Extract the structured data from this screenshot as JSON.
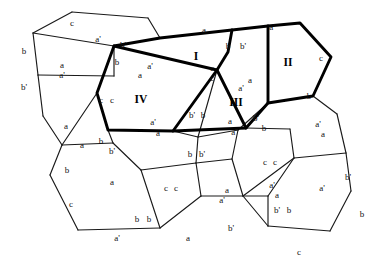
{
  "figure": {
    "background_color": "#ffffff",
    "line_color": "#1a1a1a",
    "thick_line_color": "#000000",
    "label_color": "#111111"
  },
  "regions": [
    {
      "id": "region-I",
      "label": "I",
      "x": 196,
      "y": 57,
      "emphasis": "thick"
    },
    {
      "id": "region-II",
      "label": "II",
      "x": 288,
      "y": 63,
      "emphasis": "thick"
    },
    {
      "id": "region-III",
      "label": "III",
      "x": 236,
      "y": 103,
      "emphasis": "thick"
    },
    {
      "id": "region-IV",
      "label": "IV",
      "x": 141,
      "y": 100,
      "emphasis": "thick"
    }
  ],
  "thick_outline": "M 114,46 L 160,38 L 232,30 L 268,26 L 300,23 L 331,57 L 313,96 L 268,103 L 246,128 L 173,131 L 108,130 L 97,93 L 114,46 Z",
  "thick_internal_edges": [
    "M 232,30 L 228,52 L 217,70 L 246,128",
    "M 217,70 L 173,131",
    "M 114,46 L 217,70",
    "M 268,26 L 268,103"
  ],
  "thin_edges": [
    "M 114,46 L 97,93",
    "M 97,93 L 108,130",
    "M 108,130 L 173,131",
    "M 173,131 L 246,128",
    "M 246,128 L 268,103",
    "M 268,103 L 313,96",
    "M 313,96 L 331,57",
    "M 331,57 L 300,23",
    "M 300,23 L 232,30",
    "M 232,30 L 160,38",
    "M 160,38 L 114,46",
    "M 114,46 L 33,33",
    "M 33,33 L 72,12",
    "M 72,12 L 148,18",
    "M 148,18 L 160,38",
    "M 33,33 L 38,75",
    "M 38,75 L 114,76",
    "M 114,76 L 114,46",
    "M 38,75 L 43,116",
    "M 43,116 L 62,145",
    "M 62,145 L 97,93",
    "M 62,145 L 113,143",
    "M 113,143 L 108,130",
    "M 62,145 L 50,175",
    "M 50,175 L 78,230",
    "M 78,230 L 160,228",
    "M 160,228 L 141,170",
    "M 141,170 L 113,143",
    "M 141,170 L 196,163",
    "M 196,163 L 201,196",
    "M 201,196 L 160,228",
    "M 196,163 L 232,159",
    "M 232,159 L 243,196",
    "M 243,196 L 201,196",
    "M 196,163 L 198,137",
    "M 198,137 L 173,131",
    "M 232,159 L 238,130",
    "M 243,196 L 268,226",
    "M 268,226 L 268,196",
    "M 268,196 L 243,196",
    "M 268,196 L 294,158",
    "M 294,158 L 243,196",
    "M 294,158 L 290,129",
    "M 290,129 L 246,128",
    "M 294,158 L 346,153",
    "M 346,153 L 351,191",
    "M 351,191 L 330,231",
    "M 330,231 L 268,226",
    "M 346,153 L 337,114",
    "M 337,114 L 313,96",
    "M 268,103 L 238,130",
    "M 238,130 L 198,137",
    "M 228,52 L 217,70",
    "M 217,70 L 198,137"
  ],
  "edge_labels": [
    {
      "text": "c",
      "x": 72,
      "y": 24
    },
    {
      "text": "a'",
      "x": 98,
      "y": 40
    },
    {
      "text": "b",
      "x": 24,
      "y": 52
    },
    {
      "text": "b'",
      "x": 123,
      "y": 46
    },
    {
      "text": "a",
      "x": 204,
      "y": 31
    },
    {
      "text": "a'",
      "x": 272,
      "y": 28
    },
    {
      "text": "b",
      "x": 228,
      "y": 47
    },
    {
      "text": "b'",
      "x": 243,
      "y": 47
    },
    {
      "text": "c",
      "x": 321,
      "y": 59
    },
    {
      "text": "a",
      "x": 62,
      "y": 66
    },
    {
      "text": "a'",
      "x": 62,
      "y": 76
    },
    {
      "text": "b",
      "x": 117,
      "y": 63
    },
    {
      "text": "a'",
      "x": 150,
      "y": 67
    },
    {
      "text": "a",
      "x": 140,
      "y": 76
    },
    {
      "text": "c",
      "x": 212,
      "y": 69
    },
    {
      "text": "c",
      "x": 212,
      "y": 79
    },
    {
      "text": "a'",
      "x": 241,
      "y": 89
    },
    {
      "text": "a",
      "x": 250,
      "y": 81
    },
    {
      "text": "b'",
      "x": 24,
      "y": 88
    },
    {
      "text": "c",
      "x": 101,
      "y": 101
    },
    {
      "text": "c",
      "x": 112,
      "y": 101
    },
    {
      "text": "b'",
      "x": 192,
      "y": 116
    },
    {
      "text": "b",
      "x": 203,
      "y": 116
    },
    {
      "text": "b",
      "x": 309,
      "y": 97
    },
    {
      "text": "a",
      "x": 66,
      "y": 127
    },
    {
      "text": "a",
      "x": 82,
      "y": 146
    },
    {
      "text": "a'",
      "x": 153,
      "y": 123
    },
    {
      "text": "a",
      "x": 158,
      "y": 134
    },
    {
      "text": "a",
      "x": 230,
      "y": 122
    },
    {
      "text": "a'",
      "x": 234,
      "y": 133
    },
    {
      "text": "b'",
      "x": 256,
      "y": 119
    },
    {
      "text": "b",
      "x": 264,
      "y": 129
    },
    {
      "text": "a'",
      "x": 318,
      "y": 125
    },
    {
      "text": "a",
      "x": 323,
      "y": 135
    },
    {
      "text": "b",
      "x": 101,
      "y": 142
    },
    {
      "text": "b'",
      "x": 112,
      "y": 152
    },
    {
      "text": "b",
      "x": 67,
      "y": 171
    },
    {
      "text": "b",
      "x": 190,
      "y": 155
    },
    {
      "text": "b'",
      "x": 202,
      "y": 155
    },
    {
      "text": "c",
      "x": 265,
      "y": 163
    },
    {
      "text": "c",
      "x": 275,
      "y": 163
    },
    {
      "text": "a",
      "x": 112,
      "y": 183
    },
    {
      "text": "c",
      "x": 166,
      "y": 189
    },
    {
      "text": "c",
      "x": 176,
      "y": 189
    },
    {
      "text": "a",
      "x": 227,
      "y": 191
    },
    {
      "text": "a'",
      "x": 222,
      "y": 201
    },
    {
      "text": "a'",
      "x": 322,
      "y": 189
    },
    {
      "text": "c",
      "x": 71,
      "y": 205
    },
    {
      "text": "b",
      "x": 137,
      "y": 220
    },
    {
      "text": "b",
      "x": 149,
      "y": 220
    },
    {
      "text": "b'",
      "x": 277,
      "y": 211
    },
    {
      "text": "b",
      "x": 289,
      "y": 211
    },
    {
      "text": "b",
      "x": 362,
      "y": 215
    },
    {
      "text": "a'",
      "x": 117,
      "y": 239
    },
    {
      "text": "a",
      "x": 188,
      "y": 239
    },
    {
      "text": "b'",
      "x": 231,
      "y": 229
    },
    {
      "text": "c",
      "x": 299,
      "y": 253
    },
    {
      "text": "a",
      "x": 277,
      "y": 196
    },
    {
      "text": "a'",
      "x": 272,
      "y": 186
    },
    {
      "text": "b'",
      "x": 348,
      "y": 178
    }
  ]
}
